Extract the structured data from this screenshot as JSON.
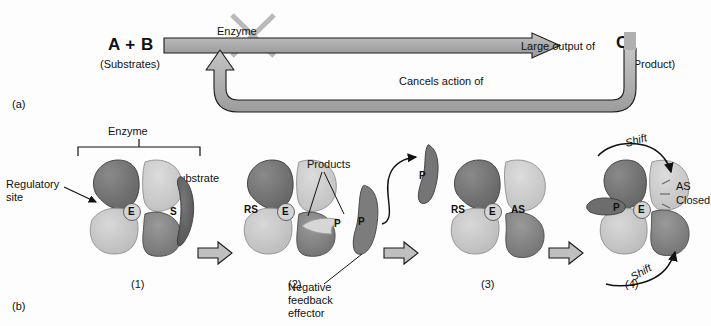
{
  "figure": {
    "panel_a_label": "(a)",
    "panel_b_label": "(b)"
  },
  "panel_a": {
    "substrates_symbol": "A + B",
    "substrates_caption": "(Substrates)",
    "enzyme_label": "Enzyme",
    "output_label": "Large output of",
    "product_symbol": "C",
    "product_caption": "(Product)",
    "feedback_label": "Cancels action of",
    "inhibition_marker": "x-cross-icon"
  },
  "panel_b": {
    "enzyme_bracket_label": "Enzyme",
    "regulatory_site_label": "Regulatory\nsite",
    "substrate_label": "Substrate",
    "products_label": "Products",
    "negative_feedback_label": "Negative\nfeedback\neffector",
    "as_closed_label": "AS\nClosed",
    "shift_label_top": "Shift",
    "shift_label_bottom": "Shift",
    "stages": [
      {
        "number": "(1)",
        "site_labels": [
          {
            "id": "active-site",
            "text": "E"
          },
          {
            "id": "substrate",
            "text": "S"
          }
        ]
      },
      {
        "number": "(2)",
        "site_labels": [
          {
            "id": "regulatory-site",
            "text": "RS"
          },
          {
            "id": "active-site",
            "text": "E"
          },
          {
            "id": "product-light",
            "text": "P"
          },
          {
            "id": "product-dark",
            "text": "P"
          }
        ]
      },
      {
        "number": "(3)",
        "site_labels": [
          {
            "id": "regulatory-site",
            "text": "RS"
          },
          {
            "id": "active-site",
            "text": "E"
          },
          {
            "id": "allosteric-site",
            "text": "AS"
          },
          {
            "id": "free-product",
            "text": "P"
          }
        ]
      },
      {
        "number": "(4)",
        "site_labels": [
          {
            "id": "bound-product",
            "text": "P"
          },
          {
            "id": "active-site",
            "text": "E"
          }
        ]
      }
    ]
  },
  "colors": {
    "lobe_dark": "#6f6f6f",
    "lobe_mid": "#8f8f8f",
    "lobe_light": "#c3c3c3",
    "lobe_lighter": "#d2d2d2",
    "substrate_dark": "#5c5c5c",
    "arrow_gray": "#b4b4b4",
    "outline": "#1a1a1a",
    "background": "#fdfdfd"
  }
}
